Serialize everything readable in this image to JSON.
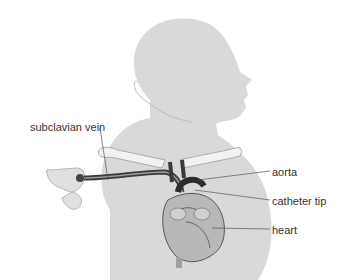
{
  "diagram": {
    "labels": {
      "subclavian_vein": "subclavian vein",
      "aorta": "aorta",
      "catheter_tip": "catheter tip",
      "heart": "heart"
    },
    "colors": {
      "body": "#d9d9d9",
      "body_outline": "#c4c4c4",
      "clavicle": "#f2f2f2",
      "vessel_dark": "#2b2b2b",
      "heart": "#b8b8b8",
      "leader_line": "#555555",
      "text": "#333333"
    }
  }
}
